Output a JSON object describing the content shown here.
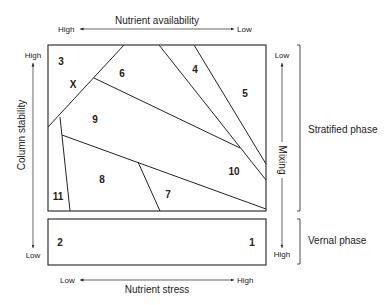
{
  "top_axis": {
    "title": "Nutrient availability",
    "left_label": "High",
    "right_label": "Low"
  },
  "bottom_axis": {
    "title": "Nutrient stress",
    "left_label": "Low",
    "right_label": "High"
  },
  "left_axis": {
    "title": "Column stability",
    "top_label": "High",
    "bottom_label": "Low"
  },
  "right_axis": {
    "title": "Mixing",
    "top_label": "Low",
    "bottom_label": "High"
  },
  "phases": {
    "stratified": "Stratified phase",
    "vernal": "Vernal phase"
  },
  "regions": {
    "r1": "1",
    "r2": "2",
    "r3": "3",
    "r4": "4",
    "r5": "5",
    "r6": "6",
    "r7": "7",
    "r8": "8",
    "r9": "9",
    "r10": "10",
    "r11": "11",
    "rx": "X"
  }
}
